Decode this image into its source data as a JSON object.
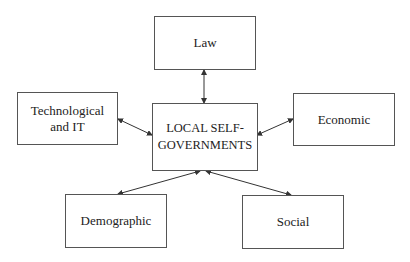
{
  "diagram": {
    "center": {
      "label": "LOCAL SELF-\nGOVERNMENTS"
    },
    "nodes": {
      "law": {
        "label": "Law"
      },
      "technological": {
        "label": "Technological\nand IT"
      },
      "economic": {
        "label": "Economic"
      },
      "demographic": {
        "label": "Demographic"
      },
      "social": {
        "label": "Social"
      }
    },
    "edges": [
      {
        "from": "LOCAL SELF-GOVERNMENTS",
        "to": "Law",
        "direction": "bidirectional"
      },
      {
        "from": "LOCAL SELF-GOVERNMENTS",
        "to": "Technological and IT",
        "direction": "bidirectional"
      },
      {
        "from": "LOCAL SELF-GOVERNMENTS",
        "to": "Economic",
        "direction": "bidirectional"
      },
      {
        "from": "LOCAL SELF-GOVERNMENTS",
        "to": "Demographic",
        "direction": "bidirectional"
      },
      {
        "from": "LOCAL SELF-GOVERNMENTS",
        "to": "Social",
        "direction": "bidirectional"
      }
    ],
    "colors": {
      "line": "#333333",
      "border": "#555555",
      "background": "#ffffff"
    }
  }
}
